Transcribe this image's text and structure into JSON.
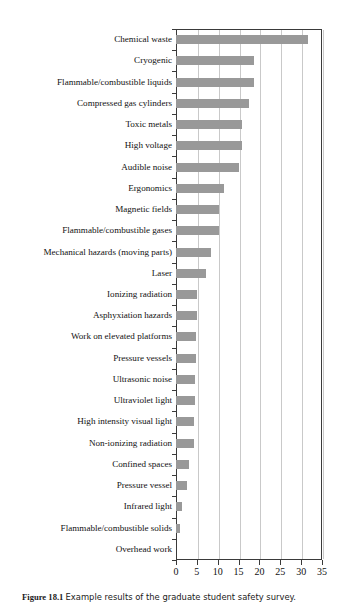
{
  "chart_data": {
    "type": "bar",
    "orientation": "horizontal",
    "title": "",
    "xlabel": "",
    "ylabel": "",
    "xlim": [
      0,
      35
    ],
    "xticks": [
      0,
      5,
      10,
      15,
      20,
      25,
      30,
      35
    ],
    "grid": "vertical",
    "legend": "none",
    "bar_color": "#999999",
    "frame_color": "#3a3a3a",
    "gridline_color": "#c9c9c9",
    "categories": [
      "Chemical waste",
      "Cryogenic",
      "Flammable/combustible liquids",
      "Compressed gas cylinders",
      "Toxic metals",
      "High voltage",
      "Audible noise",
      "Ergonomics",
      "Magnetic fields",
      "Flammable/combustible gases",
      "Mechanical hazards (moving parts)",
      "Laser",
      "Ionizing radiation",
      "Asphyxiation hazards",
      "Work on elevated platforms",
      "Pressure vessels",
      "Ultrasonic noise",
      "Ultraviolet light",
      "High intensity visual light",
      "Non-ionizing radiation",
      "Confined spaces",
      "Pressure vessel",
      "Infrared light",
      "Flammable/combustible solids",
      "Overhead work"
    ],
    "values": [
      31.7,
      18.6,
      18.7,
      17.6,
      15.9,
      15.8,
      15.0,
      11.5,
      10.3,
      10.2,
      8.5,
      7.2,
      5.1,
      5.0,
      4.8,
      4.7,
      4.6,
      4.5,
      4.4,
      4.2,
      3.2,
      2.6,
      1.4,
      1.0,
      0.0
    ]
  },
  "caption": {
    "figure_number": "Figure 18.1",
    "text": "Example results of the graduate student safety survey."
  },
  "xtick_labels": [
    "0",
    "5",
    "10",
    "15",
    "20",
    "25",
    "30",
    "35"
  ]
}
